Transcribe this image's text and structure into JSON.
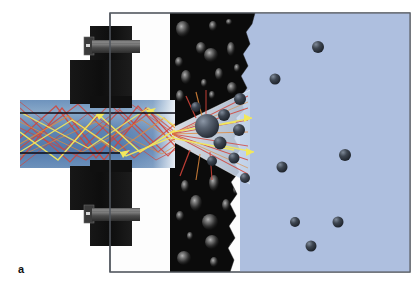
{
  "figure": {
    "panel_label": "a",
    "caption_text": "",
    "width": 420,
    "height": 293,
    "background_color": "#ffffff"
  },
  "colors": {
    "background": "#ffffff",
    "chamber_fill": "#fdfdfd",
    "chamber_border": "#5a5f66",
    "tissue_black": "#0b0b0b",
    "medium_blue": "#a9bcdd",
    "medium_blue_shade": "#9fb3d6",
    "fiber_blue": "#5a81b0",
    "fiber_blue_light": "#84a4c8",
    "fiber_blue_dark": "#4b6f9c",
    "cone_light": "#c9d8ec",
    "clamp_black": "#141414",
    "bolt_grey": "#4a4a4a",
    "bolt_grey_light": "#6f6f6f",
    "ray_red": "#d1443a",
    "ray_orange": "#e08a3c",
    "ray_yellow": "#f2e85c",
    "sphere_dark": "#2f3642",
    "sphere_mid": "#555f6e",
    "bubble_grey": "#9a9a9a",
    "axis_line": "#0a0a16",
    "label_color": "#111111"
  },
  "scene": {
    "name": "fiber-optic-light-delivery-through-tissue",
    "regions": [
      {
        "name": "sample-chamber",
        "x": 110,
        "y": 13,
        "width": 300,
        "height": 259,
        "fill": "#fdfdfd",
        "stroke": "#5a5f66"
      },
      {
        "name": "tissue-layer",
        "x": 170,
        "y": 13,
        "width": 85,
        "height": 259,
        "fill": "#0b0b0b"
      },
      {
        "name": "aqueous-medium",
        "x": 240,
        "y": 13,
        "width": 170,
        "height": 259,
        "fill": "#a9bcdd"
      }
    ],
    "fiber": {
      "name": "optical-fiber-light-guide",
      "x": 20,
      "y": 100,
      "width": 155,
      "height": 68,
      "core_line_top_y": 113,
      "core_line_bottom_y": 153
    },
    "cone": {
      "name": "emitted-light-cone",
      "apex_x": 172,
      "apex_y": 134,
      "far_x": 248,
      "top_y": 92,
      "bottom_y": 182
    },
    "clamp": {
      "name": "clamp-fixture",
      "upper_block": {
        "x": 72,
        "y": 30,
        "width": 58,
        "height": 72
      },
      "lower_block": {
        "x": 72,
        "y": 168,
        "width": 58,
        "height": 72
      },
      "upper_arm": {
        "x": 55,
        "y": 60,
        "width": 75,
        "height": 42
      },
      "lower_arm": {
        "x": 55,
        "y": 168,
        "width": 75,
        "height": 42
      },
      "upper_bolt": {
        "x": 80,
        "y": 40,
        "width": 52,
        "height": 14
      },
      "lower_bolt": {
        "x": 80,
        "y": 214,
        "width": 52,
        "height": 14
      }
    },
    "rays": {
      "count_red": 14,
      "count_yellow": 6,
      "count_orange": 5,
      "description": "multiply-reflected rays inside the light guide, fanning into a cone after the fiber tip and scattering off particles"
    },
    "particles_in_medium": [
      {
        "cx": 318,
        "cy": 47,
        "r": 6
      },
      {
        "cx": 275,
        "cy": 79,
        "r": 5.5
      },
      {
        "cx": 345,
        "cy": 155,
        "r": 6
      },
      {
        "cx": 282,
        "cy": 167,
        "r": 5.5
      },
      {
        "cx": 295,
        "cy": 222,
        "r": 5
      },
      {
        "cx": 338,
        "cy": 222,
        "r": 5.5
      },
      {
        "cx": 311,
        "cy": 246,
        "r": 5.5
      }
    ],
    "particles_at_interface": [
      {
        "cx": 207,
        "cy": 126,
        "r": 12
      },
      {
        "cx": 224,
        "cy": 115,
        "r": 6
      },
      {
        "cx": 240,
        "cy": 99,
        "r": 6
      },
      {
        "cx": 196,
        "cy": 107,
        "r": 5
      },
      {
        "cx": 220,
        "cy": 143,
        "r": 6.5
      },
      {
        "cx": 239,
        "cy": 130,
        "r": 6
      },
      {
        "cx": 234,
        "cy": 158,
        "r": 5.5
      },
      {
        "cx": 212,
        "cy": 161,
        "r": 5
      },
      {
        "cx": 245,
        "cy": 178,
        "r": 5
      }
    ],
    "bubbles_in_tissue": [
      {
        "cx": 183,
        "cy": 29,
        "rx": 7,
        "ry": 8
      },
      {
        "cx": 213,
        "cy": 26,
        "rx": 4,
        "ry": 5
      },
      {
        "cx": 229,
        "cy": 22,
        "rx": 3,
        "ry": 3
      },
      {
        "cx": 201,
        "cy": 48,
        "rx": 5,
        "ry": 6
      },
      {
        "cx": 231,
        "cy": 49,
        "rx": 4,
        "ry": 7
      },
      {
        "cx": 179,
        "cy": 62,
        "rx": 4,
        "ry": 5
      },
      {
        "cx": 211,
        "cy": 55,
        "rx": 7,
        "ry": 7
      },
      {
        "cx": 237,
        "cy": 68,
        "rx": 3,
        "ry": 4
      },
      {
        "cx": 186,
        "cy": 77,
        "rx": 5,
        "ry": 7
      },
      {
        "cx": 219,
        "cy": 74,
        "rx": 4,
        "ry": 6
      },
      {
        "cx": 204,
        "cy": 83,
        "rx": 3,
        "ry": 4
      },
      {
        "cx": 180,
        "cy": 96,
        "rx": 4,
        "ry": 6
      },
      {
        "cx": 232,
        "cy": 88,
        "rx": 5,
        "ry": 6
      },
      {
        "cx": 212,
        "cy": 95,
        "rx": 3,
        "ry": 4
      },
      {
        "cx": 185,
        "cy": 186,
        "rx": 4,
        "ry": 6
      },
      {
        "cx": 214,
        "cy": 183,
        "rx": 5,
        "ry": 8
      },
      {
        "cx": 236,
        "cy": 190,
        "rx": 3,
        "ry": 4
      },
      {
        "cx": 196,
        "cy": 203,
        "rx": 6,
        "ry": 8
      },
      {
        "cx": 226,
        "cy": 205,
        "rx": 4,
        "ry": 6
      },
      {
        "cx": 180,
        "cy": 216,
        "rx": 4,
        "ry": 5
      },
      {
        "cx": 210,
        "cy": 222,
        "rx": 8,
        "ry": 8
      },
      {
        "cx": 239,
        "cy": 226,
        "rx": 3,
        "ry": 4
      },
      {
        "cx": 190,
        "cy": 236,
        "rx": 3,
        "ry": 4
      },
      {
        "cx": 212,
        "cy": 242,
        "rx": 7,
        "ry": 7
      },
      {
        "cx": 233,
        "cy": 248,
        "rx": 4,
        "ry": 6
      },
      {
        "cx": 184,
        "cy": 258,
        "rx": 7,
        "ry": 7
      },
      {
        "cx": 214,
        "cy": 262,
        "rx": 4,
        "ry": 5
      }
    ]
  }
}
